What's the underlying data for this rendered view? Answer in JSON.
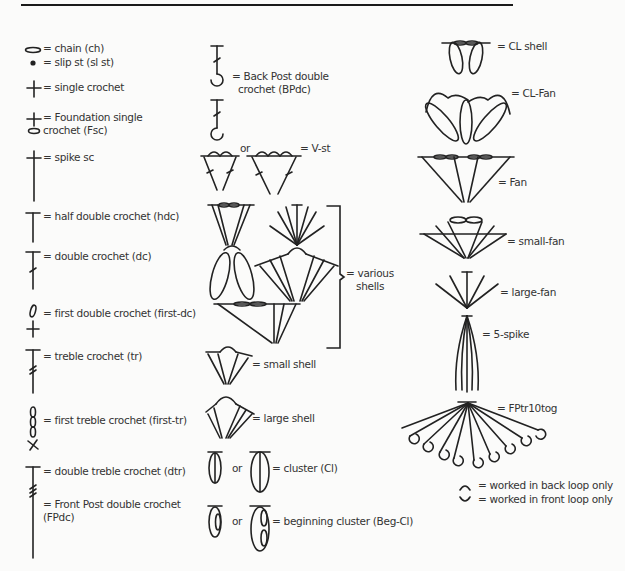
{
  "key": {
    "left_column": [
      {
        "symbol": "chain-oval",
        "label": "= chain (ch)"
      },
      {
        "symbol": "dot",
        "label": "= slip st (sl st)"
      },
      {
        "symbol": "cross",
        "label": "= single crochet"
      },
      {
        "symbol": "cross-over-oval",
        "label": "= Foundation single",
        "label2": "crochet (Fsc)"
      },
      {
        "symbol": "long-cross",
        "label": "= spike sc"
      },
      {
        "symbol": "t-post",
        "label": "= half double crochet (hdc)"
      },
      {
        "symbol": "t-post-1-bar",
        "label": "= double crochet (dc)"
      },
      {
        "symbol": "chain-loop-plus-cross",
        "label": "= first double crochet (first-dc)"
      },
      {
        "symbol": "t-post-2-bar",
        "label": "= treble crochet (tr)"
      },
      {
        "symbol": "chain-loops-plus-x",
        "label": "= first treble crochet (first-tr)"
      },
      {
        "symbol": "t-post-3-bar",
        "label": "= double treble crochet (dtr)"
      },
      {
        "symbol": "post-wavy",
        "label": "= Front Post double crochet",
        "label2": "(FPdc)"
      }
    ],
    "middle_column": [
      {
        "symbol": "post-hook",
        "label": "= Back Post double",
        "label2": "crochet (BPdc)"
      },
      {
        "symbol": "v-stitch",
        "or_label": "or",
        "label": "= V-st"
      },
      {
        "symbol": "brace",
        "label": "= various",
        "label2": "shells"
      },
      {
        "symbol": "small-shell",
        "label": "= small shell"
      },
      {
        "symbol": "large-shell",
        "label": "= large shell"
      },
      {
        "symbol": "cluster",
        "or_label": "or",
        "label": "= cluster (Cl)"
      },
      {
        "symbol": "beginning-cluster",
        "or_label": "or",
        "label": "= beginning cluster (Beg-Cl)"
      }
    ],
    "right_column": [
      {
        "symbol": "cl-shell",
        "label": "= CL shell"
      },
      {
        "symbol": "cl-fan",
        "label": "= CL-Fan"
      },
      {
        "symbol": "fan",
        "label": "= Fan"
      },
      {
        "symbol": "small-fan",
        "label": "= small-fan"
      },
      {
        "symbol": "large-fan",
        "label": "= large-fan"
      },
      {
        "symbol": "5-spike",
        "label": "= 5-spike"
      },
      {
        "symbol": "fptr10tog",
        "label": "= FPtr10tog"
      },
      {
        "symbol": "back-loop-arc",
        "label": "= worked in back loop only"
      },
      {
        "symbol": "front-loop-arc",
        "label": "= worked in front loop only"
      }
    ]
  }
}
